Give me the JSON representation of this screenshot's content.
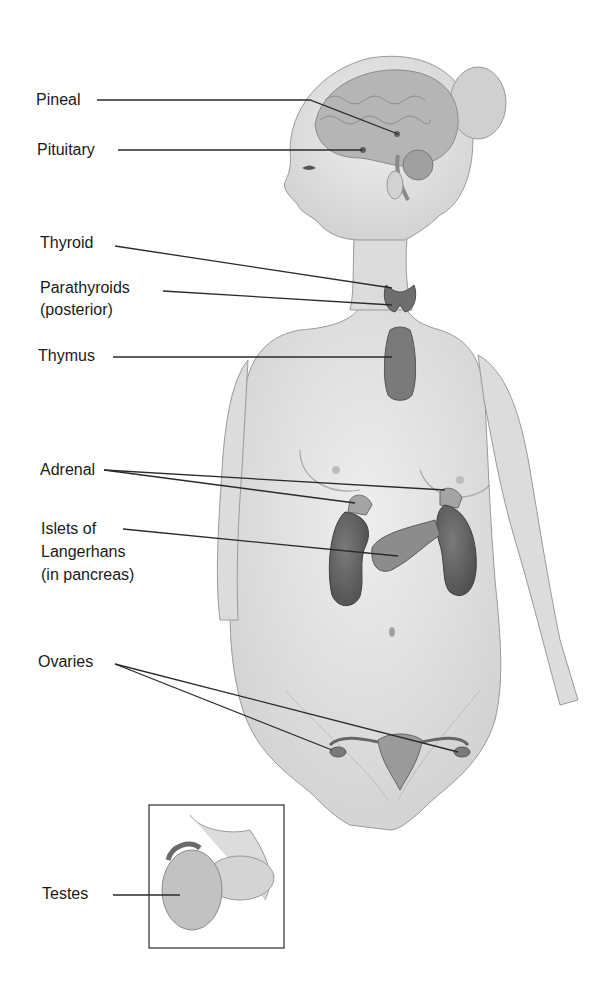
{
  "diagram": {
    "labels": [
      {
        "id": "pineal",
        "text": "Pineal"
      },
      {
        "id": "pituitary",
        "text": "Pituitary"
      },
      {
        "id": "thyroid",
        "text": "Thyroid"
      },
      {
        "id": "parathyroids",
        "text": "Parathyroids",
        "text2": "(posterior)"
      },
      {
        "id": "thymus",
        "text": "Thymus"
      },
      {
        "id": "adrenal",
        "text": "Adrenal"
      },
      {
        "id": "islets",
        "text": "Islets of",
        "text2": "Langerhans",
        "text3": "(in pancreas)"
      },
      {
        "id": "ovaries",
        "text": "Ovaries"
      },
      {
        "id": "testes",
        "text": "Testes"
      }
    ],
    "colors": {
      "skin": "#e4e4e4",
      "skin_shadow": "#c9c9c9",
      "outline": "#9a9a9a",
      "gland": "#7d7d7d",
      "gland_dark": "#5a5a5a",
      "kidney": "#6b6b6b",
      "brain": "#a8a8a8",
      "leader_line": "#2a2a2a"
    }
  }
}
